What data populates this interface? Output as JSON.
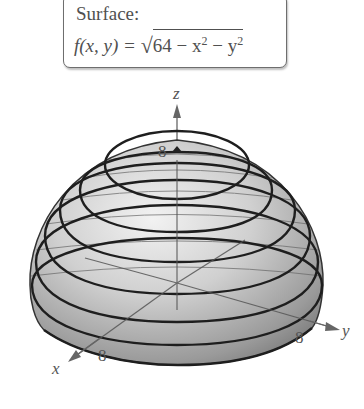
{
  "label_box": {
    "title": "Surface:",
    "formula": {
      "lhs": "f(x, y) = ",
      "radical": "√",
      "radicand_parts": [
        "64 − x",
        "2",
        " − y",
        "2"
      ],
      "full_text": "f(x, y) = √(64 − x² − y²)"
    }
  },
  "axes": {
    "z": {
      "label": "z",
      "tick_label": "8"
    },
    "x": {
      "label": "x",
      "tick_label": "8"
    },
    "y": {
      "label": "y",
      "tick_label": "8"
    }
  },
  "surface": {
    "type": "hemisphere",
    "radius": 8,
    "level_curves": 7,
    "fill_color": "#bdbdbd",
    "contour_color": "#222222"
  }
}
